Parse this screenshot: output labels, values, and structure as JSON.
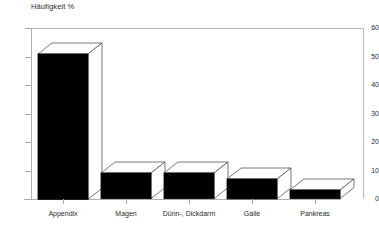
{
  "chart_data": {
    "type": "bar",
    "title": "Häufigkeit %",
    "subtitle": "",
    "xlabel": "",
    "ylabel": "Häufigkeit %",
    "categories": [
      "Appendix",
      "Magen",
      "Dünn-, Dickdarm",
      "Galle",
      "Pankreas"
    ],
    "values": [
      51,
      9,
      9,
      7,
      3
    ],
    "ylim": [
      0,
      60
    ],
    "yticks": [
      0,
      10,
      20,
      30,
      40,
      50,
      60
    ],
    "ytick_labels": [
      "0",
      "10",
      "20",
      "30",
      "40",
      "50",
      "60"
    ],
    "grid": false,
    "legend": null,
    "style": "3d-column",
    "bar_color": "#000000",
    "axis_color": "#b0b0b0",
    "text_color": "#2a2a2a"
  },
  "axis": {
    "title": "Häufigkeit %"
  }
}
